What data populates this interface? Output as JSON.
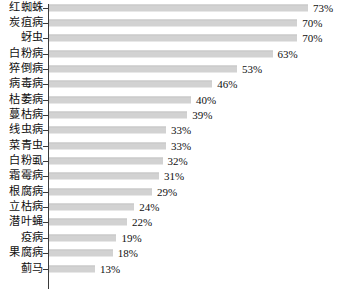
{
  "chart_data": {
    "type": "bar",
    "orientation": "horizontal",
    "title": "",
    "subtitle": "",
    "xlabel": "",
    "ylabel": "",
    "grid": false,
    "legend": null,
    "legend_position": "none",
    "value_suffix": "%",
    "xlim": [
      0,
      73
    ],
    "bar_color": "#d2d2d2",
    "axis_color": "#3a3a3a",
    "categories": [
      "红蜘蛛",
      "炭疽病",
      "蚜虫",
      "白粉病",
      "猝倒病",
      "病毒病",
      "枯萎病",
      "蔓枯病",
      "线虫病",
      "菜青虫",
      "白粉虱",
      "霜霉病",
      "根腐病",
      "立枯病",
      "潜叶蝇",
      "疫病",
      "果腐病",
      "蓟马"
    ],
    "values": [
      73,
      70,
      70,
      63,
      53,
      46,
      40,
      39,
      33,
      33,
      32,
      31,
      29,
      24,
      22,
      19,
      18,
      13
    ],
    "value_labels": [
      "73%",
      "70%",
      "70%",
      "63%",
      "53%",
      "46%",
      "40%",
      "39%",
      "33%",
      "33%",
      "32%",
      "31%",
      "29%",
      "24%",
      "22%",
      "19%",
      "18%",
      "13%"
    ]
  }
}
